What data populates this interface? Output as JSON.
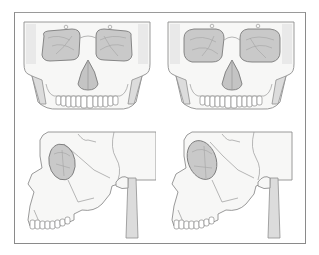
{
  "figure": {
    "panels": [
      {
        "id": "top-left",
        "view": "frontal",
        "label": ""
      },
      {
        "id": "top-right",
        "view": "frontal",
        "label": ""
      },
      {
        "id": "bottom-left",
        "view": "lateral",
        "label": ""
      },
      {
        "id": "bottom-right",
        "view": "lateral",
        "label": ""
      }
    ],
    "colors": {
      "frame": "#8a8a8a",
      "bone_fill": "#f7f7f6",
      "bone_outline": "#8f8f8f",
      "orbit_fill": "#c9c9c9",
      "background": "#ffffff"
    }
  }
}
